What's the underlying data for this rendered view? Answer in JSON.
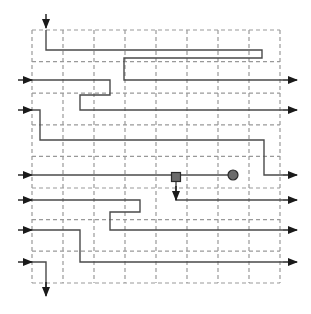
{
  "figure": {
    "name": "grid-routing-diagram",
    "type": "schematic-routing-grid",
    "width": 311,
    "height": 314,
    "background_color": "#ffffff"
  },
  "grid": {
    "name": "dashed-routing-grid",
    "columns": 8,
    "rows": 8,
    "left": 32,
    "top": 30,
    "right": 280,
    "bottom": 283,
    "cell_width": 31,
    "cell_height": 31.6,
    "x_lines": [
      32,
      63,
      94,
      125,
      156,
      187,
      218,
      249,
      280
    ],
    "y_lines": [
      30,
      61.6,
      93.2,
      124.8,
      156.4,
      188,
      219.6,
      251.2,
      283
    ],
    "line_color": "#999999",
    "line_style": "dashed",
    "line_width": 1.2,
    "dash_pattern": "4 3"
  },
  "wires": {
    "color": "#4a4a4a",
    "width": 1.4,
    "paths": [
      {
        "name": "wire-top-entry",
        "entry": "top",
        "exit": "right-edge-open",
        "points": "46,30 46,50 262,50 262,58 124,58 124,80 283,80"
      },
      {
        "name": "wire-left-row2",
        "entry": "left",
        "exit": "right",
        "points": "32,80 110,80 110,95 80,95 80,110 283,110"
      },
      {
        "name": "wire-left-row3",
        "entry": "left",
        "exit": "right",
        "points": "32,110 40,110 40,140 264,140 264,175 283,175"
      },
      {
        "name": "wire-left-row5",
        "entry": "left",
        "exit": "right-center",
        "points": "32,175 234,175"
      },
      {
        "name": "wire-square-drop",
        "entry": "marker-square",
        "exit": "right",
        "points": "176,182 176,200 283,200"
      },
      {
        "name": "wire-left-row6",
        "entry": "left",
        "exit": "segment",
        "points": "32,200 140,200 140,212 110,212 110,230 283,230"
      },
      {
        "name": "wire-left-row7",
        "entry": "left",
        "exit": "right",
        "points": "32,230 80,230 80,262 283,262"
      },
      {
        "name": "wire-left-row8-bottom-exit",
        "entry": "left",
        "exit": "bottom",
        "points": "32,262 46,262 46,295"
      }
    ]
  },
  "arrows": {
    "color": "#1a1a1a",
    "left_inputs": [
      {
        "name": "input-arrow-1",
        "x": 18,
        "y": 80,
        "direction": "right"
      },
      {
        "name": "input-arrow-2",
        "x": 18,
        "y": 110,
        "direction": "right"
      },
      {
        "name": "input-arrow-3",
        "x": 18,
        "y": 175,
        "direction": "right"
      },
      {
        "name": "input-arrow-4",
        "x": 18,
        "y": 200,
        "direction": "right"
      },
      {
        "name": "input-arrow-5",
        "x": 18,
        "y": 230,
        "direction": "right"
      },
      {
        "name": "input-arrow-6",
        "x": 18,
        "y": 262,
        "direction": "right"
      }
    ],
    "right_outputs": [
      {
        "name": "output-arrow-1",
        "x": 283,
        "y": 80,
        "direction": "right"
      },
      {
        "name": "output-arrow-2",
        "x": 283,
        "y": 110,
        "direction": "right"
      },
      {
        "name": "output-arrow-3",
        "x": 283,
        "y": 175,
        "direction": "right"
      },
      {
        "name": "output-arrow-4",
        "x": 283,
        "y": 200,
        "direction": "right"
      },
      {
        "name": "output-arrow-5",
        "x": 283,
        "y": 230,
        "direction": "right"
      },
      {
        "name": "output-arrow-6",
        "x": 283,
        "y": 262,
        "direction": "right"
      }
    ],
    "top_input": {
      "name": "top-input-arrow",
      "x": 46,
      "y": 14,
      "direction": "down"
    },
    "bottom_output": {
      "name": "bottom-output-arrow",
      "x": 46,
      "y": 282,
      "direction": "down"
    },
    "interior_output": {
      "name": "interior-down-arrow",
      "x": 176,
      "y": 186,
      "direction": "down"
    }
  },
  "markers": [
    {
      "name": "marker-square",
      "shape": "square",
      "x": 176,
      "y": 177,
      "size": 9,
      "fill": "#6b6b6b",
      "stroke": "#2a2a2a"
    },
    {
      "name": "marker-circle",
      "shape": "circle",
      "x": 233,
      "y": 175,
      "radius": 5,
      "fill": "#6b6b6b",
      "stroke": "#2a2a2a"
    }
  ]
}
